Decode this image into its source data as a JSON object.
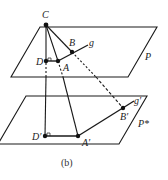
{
  "figure": {
    "caption": "(b)",
    "colors": {
      "stroke": "#1a1a1a",
      "background": "#ffffff"
    },
    "planes": {
      "upper": {
        "label": "P",
        "corners": [
          [
            40,
            27
          ],
          [
            157,
            27
          ],
          [
            128,
            77
          ],
          [
            11,
            77
          ]
        ]
      },
      "lower": {
        "label": "P*",
        "corners": [
          [
            26,
            96
          ],
          [
            147,
            96
          ],
          [
            119,
            144
          ],
          [
            -2,
            144
          ]
        ]
      }
    },
    "points": {
      "C": {
        "label": "C",
        "x": 46,
        "y": 25
      },
      "D": {
        "label": "D",
        "x": 46,
        "y": 61
      },
      "A": {
        "label": "A",
        "x": 58,
        "y": 61
      },
      "B": {
        "label": "B",
        "x": 72,
        "y": 52
      },
      "Dp": {
        "label": "D′",
        "x": 45,
        "y": 136
      },
      "Ap": {
        "label": "A′",
        "x": 78,
        "y": 136
      },
      "Bp": {
        "label": "B′",
        "x": 123,
        "y": 108
      }
    },
    "lines": {
      "g": {
        "label": "g"
      },
      "gp": {
        "label": "g′"
      }
    }
  }
}
